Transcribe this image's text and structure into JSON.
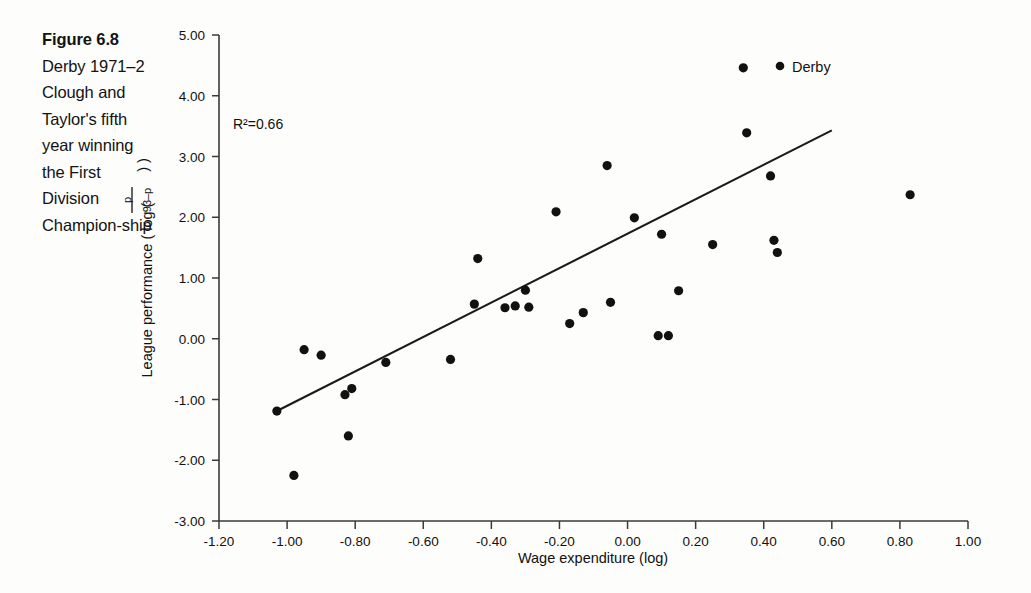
{
  "figure": {
    "number_label": "Figure 6.8",
    "caption": "Derby 1971–2 Clough and Taylor's fifth year winning the First Division Champion-ship"
  },
  "annotations": {
    "r_squared": "R²=0.66",
    "highlight_point_label": "Derby"
  },
  "axis": {
    "x_title": "Wage expenditure (log)",
    "y_title_prefix": "League performance ( log (",
    "y_title_suffix": ") )",
    "y_fraction_numerator": "p",
    "y_fraction_denominator": "93–p",
    "x_ticks": [
      "-1.20",
      "-1.00",
      "-0.80",
      "-0.60",
      "-0.40",
      "-0.20",
      "0.00",
      "0.20",
      "0.40",
      "0.60",
      "0.80",
      "1.00"
    ],
    "y_ticks": [
      "5.00",
      "4.00",
      "3.00",
      "2.00",
      "1.00",
      "0.00",
      "-1.00",
      "-2.00",
      "-3.00"
    ]
  },
  "colors": {
    "point": "#111111",
    "line": "#1a1a1a",
    "axis": "#3a3a3a",
    "background": "#fdfdfc",
    "text": "#131313"
  },
  "chart_data": {
    "type": "scatter",
    "xlabel": "Wage expenditure (log)",
    "ylabel": "League performance ( log ( p / (93-p) ) )",
    "xlim": [
      -1.2,
      1.0
    ],
    "ylim": [
      -3.0,
      5.0
    ],
    "grid": false,
    "legend": false,
    "x": [
      -1.03,
      -0.98,
      -0.95,
      -0.9,
      -0.83,
      -0.82,
      -0.81,
      -0.71,
      -0.52,
      -0.45,
      -0.44,
      -0.36,
      -0.33,
      -0.3,
      -0.29,
      -0.21,
      -0.17,
      -0.13,
      -0.06,
      -0.05,
      0.02,
      0.09,
      0.1,
      0.12,
      0.15,
      0.25,
      0.34,
      0.35,
      0.42,
      0.43,
      0.44,
      0.83
    ],
    "y": [
      -1.19,
      -2.25,
      -0.18,
      -0.27,
      -0.92,
      -1.6,
      -0.82,
      -0.39,
      -0.34,
      0.57,
      1.32,
      0.51,
      0.54,
      0.8,
      0.52,
      2.09,
      0.25,
      0.43,
      2.85,
      0.6,
      1.99,
      0.05,
      1.72,
      0.05,
      0.79,
      1.55,
      4.46,
      3.39,
      2.68,
      1.62,
      1.42,
      2.37
    ],
    "highlighted_point": {
      "label": "Derby",
      "x": 0.34,
      "y": 4.46
    },
    "trendline": {
      "type": "linear",
      "x_start": -1.03,
      "y_start": -1.19,
      "x_end": 0.6,
      "y_end": 3.43,
      "r_squared": 0.66
    },
    "r_squared_text": "R²=0.66",
    "n_points": 32
  }
}
